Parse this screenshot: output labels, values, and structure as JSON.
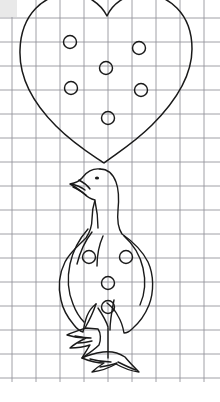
{
  "document": {
    "kind": "line-drawing-on-graph-paper",
    "title": "Heart balloon above standing bird",
    "width": 220,
    "height": 402,
    "background_color": "#ffffff",
    "ink_color": "#1a1a1a",
    "grid_color": "#8e8e96"
  },
  "grid": {
    "name": "graph-paper-grid",
    "cell_size": 24,
    "line_width": 0.9,
    "color": "#8e8e96",
    "origin_x": 12,
    "origin_y": 18,
    "vertical_lines_x": [
      12,
      36,
      60,
      84,
      108,
      132,
      156,
      180,
      204
    ],
    "horizontal_lines_y": [
      18,
      42,
      66,
      90,
      114,
      138,
      162,
      186,
      210,
      234,
      258,
      282,
      306,
      330,
      354,
      378
    ],
    "x_extent": [
      0,
      220
    ],
    "y_extent": [
      0,
      382
    ],
    "bottom_margin_blank": true
  },
  "corner_mark": {
    "name": "scan-corner-shade",
    "color": "#e9e9e9",
    "x": 0,
    "y": 0,
    "width": 17,
    "height": 17
  },
  "heart": {
    "name": "heart-outline",
    "notch_point": {
      "x": 107,
      "y": 16
    },
    "tip_point": {
      "x": 104,
      "y": 163
    },
    "left_extent": 20,
    "right_extent": 192,
    "top_extent": 0,
    "stroke_width": 1.5
  },
  "heart_circles": [
    {
      "label": "heart-circle-upper-left",
      "cx": 70,
      "cy": 42,
      "r": 6.5
    },
    {
      "label": "heart-circle-upper-right",
      "cx": 139,
      "cy": 48,
      "r": 6.5
    },
    {
      "label": "heart-circle-center",
      "cx": 106,
      "cy": 68,
      "r": 6.5
    },
    {
      "label": "heart-circle-lower-left",
      "cx": 71,
      "cy": 88,
      "r": 6.5
    },
    {
      "label": "heart-circle-lower-right",
      "cx": 141,
      "cy": 90,
      "r": 6.5
    },
    {
      "label": "heart-circle-bottom",
      "cx": 108,
      "cy": 118,
      "r": 6.5
    }
  ],
  "bird": {
    "name": "standing-bird-outline",
    "pose": "standing, facing left",
    "head_top_y": 168,
    "beak_tip": {
      "x": 70,
      "y": 183
    },
    "eye": {
      "cx": 97,
      "cy": 178,
      "r": 1.6
    },
    "body_left_extent": 58,
    "body_right_extent": 152,
    "tail_bottom_y": 330,
    "feet_bottom_y": 372,
    "stroke_width": 1.4
  },
  "bird_circles": [
    {
      "label": "bird-circle-upper-left",
      "cx": 89,
      "cy": 257,
      "r": 6.5
    },
    {
      "label": "bird-circle-upper-right",
      "cx": 126,
      "cy": 257,
      "r": 6.5
    },
    {
      "label": "bird-circle-middle",
      "cx": 108,
      "cy": 283,
      "r": 6.5
    },
    {
      "label": "bird-circle-lower",
      "cx": 108,
      "cy": 307,
      "r": 6.5
    }
  ],
  "counts": {
    "total_circles": 10,
    "heart_circles": 6,
    "bird_circles": 4
  }
}
